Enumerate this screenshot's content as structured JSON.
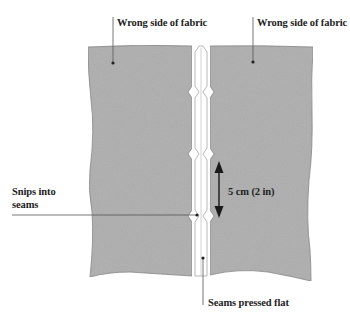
{
  "diagram": {
    "type": "sewing-illustration",
    "interpretation_note": "The white strip is read as two seam allowances pressed open; the centre line is assumed to be the stitching line. Based on standard sewing-diagram convention, not verifiable from the image alone.",
    "colors": {
      "background": "#ffffff",
      "fabric": "#b3b3b3",
      "fabric_edge": "#8a8a8a",
      "seam_allowance": "#ffffff",
      "text": "#222222",
      "leader_line": "#555555",
      "arrow": "#1a1a1a"
    }
  },
  "labels": {
    "wrong_side_left": "Wrong side of fabric",
    "wrong_side_right": "Wrong side of fabric",
    "snips_line1": "Snips into",
    "snips_line2": "seams",
    "measurement": "5 cm (2 in)",
    "seams_pressed": "Seams pressed flat"
  },
  "geometry": {
    "fabric_bounds": {
      "left": 88,
      "right": 313,
      "top": 46,
      "bottom": 280
    },
    "seam_strip": {
      "left": 195,
      "right": 207,
      "center": 201
    },
    "snip_positions_y": [
      92,
      154,
      216
    ],
    "snip_spacing_label": "5 cm (2 in)"
  }
}
